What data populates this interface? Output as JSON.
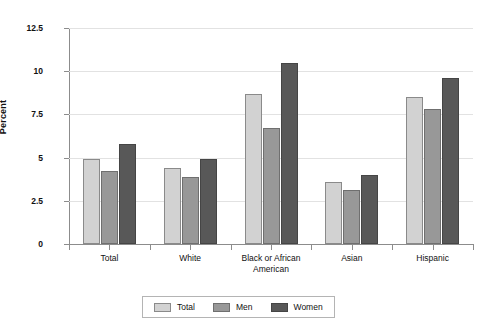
{
  "chart_data": {
    "type": "bar",
    "title": "",
    "xlabel": "",
    "ylabel": "Percent",
    "ylim": [
      0,
      12.5
    ],
    "yticks": [
      0,
      2.5,
      5,
      7.5,
      10,
      12.5
    ],
    "ytick_labels": [
      "0",
      "2.5",
      "5",
      "7.5",
      "10",
      "12.5"
    ],
    "grid": true,
    "legend_position": "bottom-center",
    "categories": [
      "Total",
      "White",
      "Black or African\nAmerican",
      "Asian",
      "Hispanic"
    ],
    "series": [
      {
        "name": "Total",
        "color": "#d2d2d2",
        "values": [
          4.9,
          4.4,
          8.7,
          3.6,
          8.5
        ]
      },
      {
        "name": "Men",
        "color": "#989898",
        "values": [
          4.2,
          3.9,
          6.7,
          3.1,
          7.8
        ]
      },
      {
        "name": "Women",
        "color": "#585858",
        "values": [
          5.8,
          4.9,
          10.5,
          4.0,
          9.6
        ]
      }
    ]
  },
  "legend": {
    "items": [
      {
        "label": "Total"
      },
      {
        "label": "Men"
      },
      {
        "label": "Women"
      }
    ]
  },
  "colors": {
    "series_total": "#d2d2d2",
    "series_men": "#989898",
    "series_women": "#585858",
    "gridline": "#e2e2e2",
    "axis": "#8c8c8c",
    "text": "#111111",
    "background": "#ffffff"
  }
}
